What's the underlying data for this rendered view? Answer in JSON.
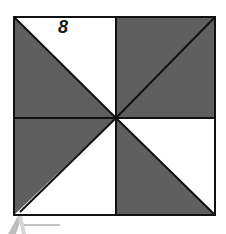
{
  "figure": {
    "label": "8",
    "colors": {
      "shaded": "#5f5f5f",
      "unshaded": "#ffffff",
      "stroke": "#111111"
    }
  }
}
